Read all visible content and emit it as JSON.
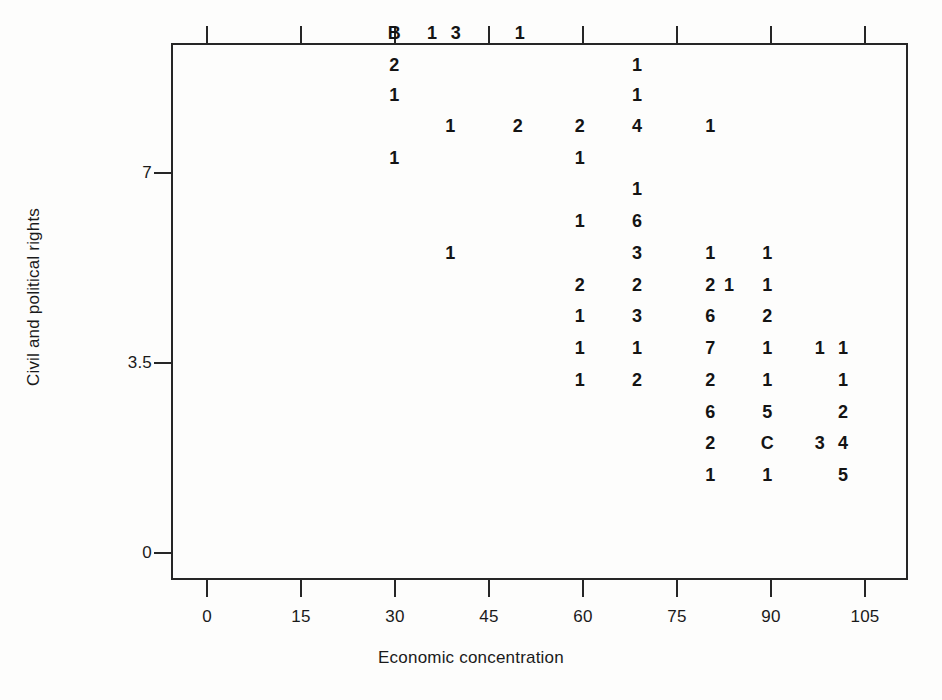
{
  "chart_data": {
    "type": "scatter",
    "title": "",
    "xlabel": "Economic concentration",
    "ylabel": "Civil and political rights",
    "xlim": [
      -4.3,
      113.4
    ],
    "ylim": [
      -0.55,
      9.25
    ],
    "xticks": [
      0,
      15,
      30,
      45,
      60,
      75,
      90,
      105
    ],
    "xticklabels": [
      "0",
      "15",
      "30",
      "45",
      "60",
      "75",
      "90",
      "105"
    ],
    "yticks": [
      0,
      3.5,
      7,
      10.5
    ],
    "yticklabels": [
      "0",
      "3.5",
      "7",
      "10.5"
    ],
    "grid": false,
    "legend": null,
    "marker_style": "text-glyph-count",
    "note": "Each plotted glyph is a digit or letter denoting the number of overlapping observations at that coordinate (letters continue past 9: B=11, C=12).",
    "points": [
      {
        "x": 29.9,
        "y": 9.58,
        "label": "B"
      },
      {
        "x": 35.9,
        "y": 9.58,
        "label": "1"
      },
      {
        "x": 39.7,
        "y": 9.58,
        "label": "3"
      },
      {
        "x": 49.9,
        "y": 9.58,
        "label": "1"
      },
      {
        "x": 29.9,
        "y": 8.99,
        "label": "2"
      },
      {
        "x": 68.6,
        "y": 8.99,
        "label": "1"
      },
      {
        "x": 29.9,
        "y": 8.44,
        "label": "1"
      },
      {
        "x": 68.6,
        "y": 8.44,
        "label": "1"
      },
      {
        "x": 38.8,
        "y": 7.87,
        "label": "1"
      },
      {
        "x": 49.6,
        "y": 7.87,
        "label": "2"
      },
      {
        "x": 59.5,
        "y": 7.87,
        "label": "2"
      },
      {
        "x": 68.6,
        "y": 7.87,
        "label": "4"
      },
      {
        "x": 80.3,
        "y": 7.87,
        "label": "1"
      },
      {
        "x": 29.9,
        "y": 7.28,
        "label": "1"
      },
      {
        "x": 59.5,
        "y": 7.28,
        "label": "1"
      },
      {
        "x": 68.6,
        "y": 6.71,
        "label": "1"
      },
      {
        "x": 59.5,
        "y": 6.12,
        "label": "1"
      },
      {
        "x": 68.6,
        "y": 6.12,
        "label": "6"
      },
      {
        "x": 38.8,
        "y": 5.53,
        "label": "1"
      },
      {
        "x": 68.6,
        "y": 5.53,
        "label": "3"
      },
      {
        "x": 80.3,
        "y": 5.53,
        "label": "1"
      },
      {
        "x": 89.4,
        "y": 5.53,
        "label": "1"
      },
      {
        "x": 59.5,
        "y": 4.94,
        "label": "2"
      },
      {
        "x": 68.6,
        "y": 4.94,
        "label": "2"
      },
      {
        "x": 80.3,
        "y": 4.94,
        "label": "2"
      },
      {
        "x": 83.3,
        "y": 4.94,
        "label": "1"
      },
      {
        "x": 89.4,
        "y": 4.94,
        "label": "1"
      },
      {
        "x": 59.5,
        "y": 4.37,
        "label": "1"
      },
      {
        "x": 68.6,
        "y": 4.37,
        "label": "3"
      },
      {
        "x": 80.3,
        "y": 4.37,
        "label": "6"
      },
      {
        "x": 89.4,
        "y": 4.37,
        "label": "2"
      },
      {
        "x": 59.5,
        "y": 3.78,
        "label": "1"
      },
      {
        "x": 68.6,
        "y": 3.78,
        "label": "1"
      },
      {
        "x": 80.3,
        "y": 3.78,
        "label": "7"
      },
      {
        "x": 89.4,
        "y": 3.78,
        "label": "1"
      },
      {
        "x": 97.8,
        "y": 3.78,
        "label": "1"
      },
      {
        "x": 101.5,
        "y": 3.78,
        "label": "1"
      },
      {
        "x": 59.5,
        "y": 3.19,
        "label": "1"
      },
      {
        "x": 68.6,
        "y": 3.19,
        "label": "2"
      },
      {
        "x": 80.3,
        "y": 3.19,
        "label": "2"
      },
      {
        "x": 89.4,
        "y": 3.19,
        "label": "1"
      },
      {
        "x": 101.5,
        "y": 3.19,
        "label": "1"
      },
      {
        "x": 80.3,
        "y": 2.6,
        "label": "6"
      },
      {
        "x": 89.4,
        "y": 2.6,
        "label": "5"
      },
      {
        "x": 101.5,
        "y": 2.6,
        "label": "2"
      },
      {
        "x": 80.3,
        "y": 2.03,
        "label": "2"
      },
      {
        "x": 89.4,
        "y": 2.03,
        "label": "C"
      },
      {
        "x": 97.8,
        "y": 2.03,
        "label": "3"
      },
      {
        "x": 101.5,
        "y": 2.03,
        "label": "4"
      },
      {
        "x": 80.3,
        "y": 1.44,
        "label": "1"
      },
      {
        "x": 89.4,
        "y": 1.44,
        "label": "1"
      },
      {
        "x": 101.5,
        "y": 1.44,
        "label": "5"
      }
    ]
  },
  "axes": {
    "x_title": "Economic concentration",
    "y_title": "Civil and political rights",
    "x_tick_labels": [
      "0",
      "15",
      "30",
      "45",
      "60",
      "75",
      "90",
      "105"
    ],
    "y_tick_labels": [
      "10.5",
      "7",
      "3.5",
      "0"
    ]
  },
  "colors": {
    "frame": "#262626",
    "text": "#1a1a1a",
    "data": "#141414",
    "background": "#fdfdfc"
  }
}
